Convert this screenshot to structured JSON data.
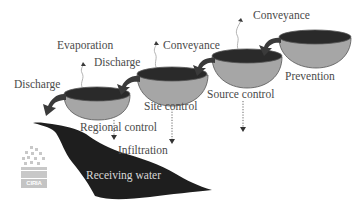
{
  "diagram": {
    "type": "stormwater-management-train",
    "colors": {
      "bowl_top": "#2a2a2a",
      "bowl_body": "#a6a6a6",
      "water": "#1e1e1e",
      "text": "#4a4a4a",
      "arrow": "#3a3a3a"
    },
    "stages": [
      {
        "label": "Prevention"
      },
      {
        "label": "Source control"
      },
      {
        "label": "Site control"
      },
      {
        "label": "Regional control"
      }
    ],
    "flows": [
      {
        "label": "Conveyance",
        "position": "top-right"
      },
      {
        "label": "Conveyance",
        "position": "middle"
      },
      {
        "label": "Discharge",
        "position": "upper-left"
      },
      {
        "label": "Discharge",
        "position": "left"
      },
      {
        "label": "Evaporation",
        "position": "top-left"
      },
      {
        "label": "Infiltration",
        "position": "bottom"
      }
    ],
    "receiving_water": "Receiving water",
    "logo": "CIRIA"
  }
}
